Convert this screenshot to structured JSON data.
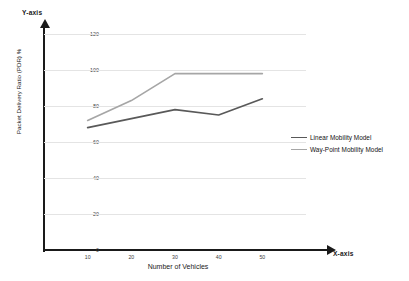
{
  "chart_data": {
    "type": "line",
    "title": "",
    "xlabel": "Number of Vehicles",
    "ylabel": "Packet Delivery Ratio (PDR) %",
    "x_axis_title": "X-axis",
    "y_axis_title": "Y-axis",
    "categories": [
      "10",
      "20",
      "30",
      "40",
      "50"
    ],
    "x": [
      10,
      20,
      30,
      40,
      50
    ],
    "xlim": [
      0,
      60
    ],
    "ylim": [
      0,
      120
    ],
    "yticks": [
      "0",
      "20",
      "40",
      "60",
      "80",
      "100",
      "120"
    ],
    "ytick_values": [
      0,
      20,
      40,
      60,
      80,
      100,
      120
    ],
    "grid": true,
    "legend_position": "right",
    "series": [
      {
        "name": "Linear Mobility Model",
        "color": "#595959",
        "values": [
          68,
          73,
          78,
          75,
          84
        ]
      },
      {
        "name": "Way-Point Mobility Model",
        "color": "#a6a6a6",
        "values": [
          72,
          83,
          98,
          98,
          98
        ]
      }
    ]
  },
  "colors": {
    "axis": "#1a1a1a",
    "grid": "#e4e4e4",
    "background": "#ffffff",
    "series_linear": "#595959",
    "series_waypoint": "#a6a6a6"
  }
}
